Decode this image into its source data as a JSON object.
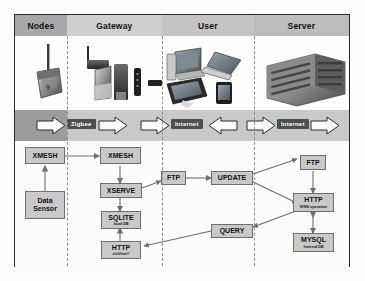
{
  "figure": {
    "type": "block-architecture-diagram"
  },
  "columns": [
    {
      "id": "nodes",
      "label": "Nodes",
      "header_color": "#a8a8a8"
    },
    {
      "id": "gateway",
      "label": "Gateway",
      "header_color": "#cfcfcf"
    },
    {
      "id": "user",
      "label": "User",
      "header_color": "#c4c4c4"
    },
    {
      "id": "server",
      "label": "Server",
      "header_color": "#bdbdbd"
    }
  ],
  "devices": [
    {
      "column": "nodes",
      "name": "wireless-sensor-mote"
    },
    {
      "column": "gateway",
      "name": "antenna-gateway"
    },
    {
      "column": "gateway",
      "name": "gateway-box"
    },
    {
      "column": "gateway",
      "name": "router-tower"
    },
    {
      "column": "gateway",
      "name": "usb-stick"
    },
    {
      "column": "user",
      "name": "desktop-computer"
    },
    {
      "column": "user",
      "name": "laptop-computer"
    },
    {
      "column": "user",
      "name": "tablet-device"
    },
    {
      "column": "user",
      "name": "smartphone-device"
    },
    {
      "column": "server",
      "name": "server-rack"
    }
  ],
  "protocol_band": {
    "chips": [
      {
        "label": "Zigbee",
        "name": "zigbee-chip"
      },
      {
        "label": "Internet",
        "name": "internet-chip-user"
      },
      {
        "label": "Internet",
        "name": "internet-chip-server"
      }
    ],
    "arrows": [
      {
        "name": "arrow-nodes-to-zigbee",
        "direction": "right"
      },
      {
        "name": "arrow-zigbee-to-gateway",
        "direction": "right"
      },
      {
        "name": "arrow-gateway-to-internet",
        "direction": "right"
      },
      {
        "name": "arrow-internet-to-gateway",
        "direction": "left"
      },
      {
        "name": "arrow-user-to-internet",
        "direction": "right"
      },
      {
        "name": "arrow-internet-to-server",
        "direction": "right"
      }
    ]
  },
  "flow": {
    "nodes": [
      {
        "id": "xmesh-node",
        "label": "XMESH",
        "sub": "",
        "column": "nodes"
      },
      {
        "id": "data-sensor",
        "label": "Data",
        "label2": "Sensor",
        "sub": "",
        "column": "nodes"
      },
      {
        "id": "xmesh-gateway",
        "label": "XMESH",
        "sub": "",
        "column": "gateway"
      },
      {
        "id": "xserve",
        "label": "XSERVE",
        "sub": "",
        "column": "gateway"
      },
      {
        "id": "sqlite",
        "label": "SQLITE",
        "sub": "local DB",
        "column": "gateway"
      },
      {
        "id": "http-gateway",
        "label": "HTTP",
        "sub": "eloView®",
        "column": "gateway"
      },
      {
        "id": "ftp-gateway",
        "label": "FTP",
        "sub": "",
        "column": "gateway"
      },
      {
        "id": "update",
        "label": "UPDATE",
        "sub": "",
        "column": "user"
      },
      {
        "id": "query",
        "label": "QUERY",
        "sub": "",
        "column": "user"
      },
      {
        "id": "ftp-server",
        "label": "FTP",
        "sub": "",
        "column": "server"
      },
      {
        "id": "http-server",
        "label": "HTTP",
        "sub": "WSN operation",
        "column": "server"
      },
      {
        "id": "mysql",
        "label": "MYSQL",
        "sub": "Internal DB",
        "column": "server"
      }
    ],
    "edges": [
      {
        "from": "data-sensor",
        "to": "xmesh-node",
        "name": "edge-sensor-to-xmesh"
      },
      {
        "from": "xmesh-node",
        "to": "xmesh-gateway",
        "name": "edge-xmesh-to-xmesh"
      },
      {
        "from": "xmesh-gateway",
        "to": "xserve",
        "name": "edge-xmesh-to-xserve"
      },
      {
        "from": "xserve",
        "to": "sqlite",
        "name": "edge-xserve-to-sqlite",
        "bidirectional": true
      },
      {
        "from": "http-gateway",
        "to": "sqlite",
        "name": "edge-http-to-sqlite"
      },
      {
        "from": "xserve",
        "to": "ftp-gateway",
        "name": "edge-xserve-to-ftp"
      },
      {
        "from": "ftp-gateway",
        "to": "update",
        "name": "edge-ftp-to-update"
      },
      {
        "from": "update",
        "to": "ftp-server",
        "name": "edge-update-to-ftp-server"
      },
      {
        "from": "update",
        "to": "http-server",
        "name": "edge-update-to-http-server"
      },
      {
        "from": "http-server",
        "to": "query",
        "name": "edge-http-to-query"
      },
      {
        "from": "query",
        "to": "http-gateway",
        "name": "edge-query-to-http-gateway"
      },
      {
        "from": "ftp-server",
        "to": "http-server",
        "name": "edge-ftp-to-http-server"
      },
      {
        "from": "http-server",
        "to": "mysql",
        "name": "edge-http-to-mysql",
        "bidirectional": true
      }
    ]
  },
  "colors": {
    "box_fill": "#c9c9c9",
    "box_border": "#6e6e6e",
    "chip_fill": "#4e4e4e",
    "band_left": "#9c9c9c",
    "band_right": "#c9c9c9",
    "frame": "#2b2b2b"
  }
}
